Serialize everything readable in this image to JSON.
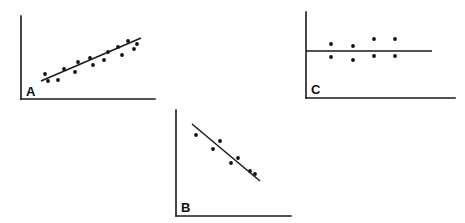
{
  "figure": {
    "background_color": "#ffffff",
    "ink_color": "#101010",
    "width": 465,
    "height": 223
  },
  "chart_data": [
    {
      "type": "scatter",
      "panel_id": "A",
      "label": "A",
      "title": "",
      "xlabel": "",
      "ylabel": "",
      "relationship": "positive correlation",
      "grid": false,
      "legend": "none",
      "axes": {
        "y_axis": {
          "x": 21,
          "y_top": 16,
          "y_bottom": 99
        },
        "x_axis": {
          "y": 99,
          "x_left": 21,
          "x_right": 155
        }
      },
      "xlim": [
        21,
        155
      ],
      "ylim": [
        16,
        99
      ],
      "points": [
        {
          "x": 45,
          "y": 74
        },
        {
          "x": 48,
          "y": 81
        },
        {
          "x": 58,
          "y": 80
        },
        {
          "x": 64,
          "y": 69
        },
        {
          "x": 75,
          "y": 72
        },
        {
          "x": 78,
          "y": 62
        },
        {
          "x": 90,
          "y": 58
        },
        {
          "x": 93,
          "y": 65
        },
        {
          "x": 104,
          "y": 60
        },
        {
          "x": 108,
          "y": 52
        },
        {
          "x": 118,
          "y": 47
        },
        {
          "x": 122,
          "y": 55
        },
        {
          "x": 128,
          "y": 41
        },
        {
          "x": 134,
          "y": 49
        },
        {
          "x": 137,
          "y": 44
        }
      ],
      "trend_line": {
        "x1": 41,
        "y1": 81,
        "x2": 141,
        "y2": 38
      }
    },
    {
      "type": "scatter",
      "panel_id": "B",
      "label": "B",
      "title": "",
      "xlabel": "",
      "ylabel": "",
      "relationship": "negative correlation",
      "grid": false,
      "legend": "none",
      "axes": {
        "y_axis": {
          "x": 176,
          "y_top": 110,
          "y_bottom": 216
        },
        "x_axis": {
          "y": 216,
          "x_left": 176,
          "x_right": 291
        }
      },
      "xlim": [
        176,
        291
      ],
      "ylim": [
        110,
        216
      ],
      "points": [
        {
          "x": 196,
          "y": 135
        },
        {
          "x": 213,
          "y": 149
        },
        {
          "x": 220,
          "y": 141
        },
        {
          "x": 231,
          "y": 163
        },
        {
          "x": 238,
          "y": 158
        },
        {
          "x": 250,
          "y": 171
        },
        {
          "x": 255,
          "y": 174
        }
      ],
      "trend_line": {
        "x1": 192,
        "y1": 124,
        "x2": 260,
        "y2": 181
      }
    },
    {
      "type": "scatter",
      "panel_id": "C",
      "label": "C",
      "title": "",
      "xlabel": "",
      "ylabel": "",
      "relationship": "no correlation",
      "grid": false,
      "legend": "none",
      "axes": {
        "y_axis": {
          "x": 306,
          "y_top": 12,
          "y_bottom": 98
        },
        "x_axis": {
          "y": 98,
          "x_left": 306,
          "x_right": 455
        }
      },
      "xlim": [
        306,
        455
      ],
      "ylim": [
        12,
        98
      ],
      "points": [
        {
          "x": 331,
          "y": 44
        },
        {
          "x": 331,
          "y": 57
        },
        {
          "x": 353,
          "y": 46
        },
        {
          "x": 353,
          "y": 60
        },
        {
          "x": 374,
          "y": 39
        },
        {
          "x": 374,
          "y": 56
        },
        {
          "x": 395,
          "y": 39
        },
        {
          "x": 395,
          "y": 56
        }
      ],
      "trend_line": {
        "x1": 306,
        "y1": 51,
        "x2": 432,
        "y2": 51
      }
    }
  ],
  "labels": {
    "panel_a": "A",
    "panel_b": "B",
    "panel_c": "C"
  },
  "label_positions": {
    "panel_a": {
      "x": 26,
      "y": 96
    },
    "panel_b": {
      "x": 181,
      "y": 212
    },
    "panel_c": {
      "x": 311,
      "y": 94
    }
  }
}
